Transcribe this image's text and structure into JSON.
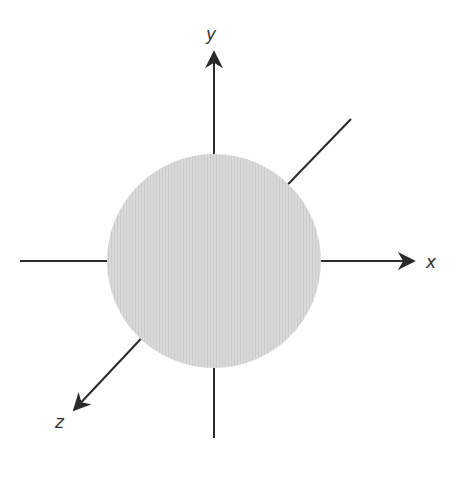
{
  "diagram": {
    "sphere": {
      "cx": 214,
      "cy": 261,
      "r": 107,
      "fill": "#d6d6d6"
    },
    "axes": {
      "x": {
        "label": "x",
        "from": [
          20,
          261
        ],
        "to": [
          416,
          261
        ],
        "arrow": true
      },
      "y": {
        "label": "y",
        "from": [
          214,
          438
        ],
        "to": [
          214,
          50
        ],
        "arrow": true
      },
      "z": {
        "label": "z",
        "from": [
          351,
          119
        ],
        "to": [
          73,
          412
        ],
        "arrow": true
      }
    },
    "line_color": "#2a2a2a"
  }
}
